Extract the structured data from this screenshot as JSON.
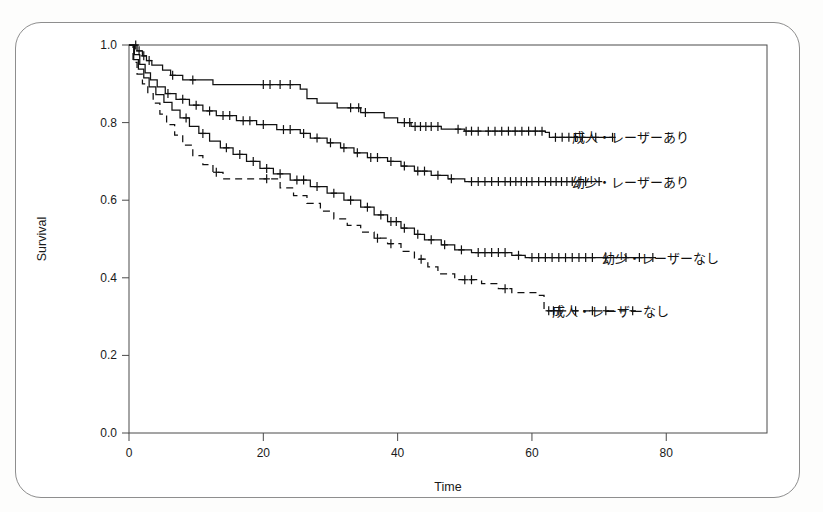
{
  "page": {
    "faint_header_text": "",
    "background": "#ffffff",
    "border_color": "#8e8e8e"
  },
  "chart_data": {
    "type": "line",
    "subtype": "kaplan-meier-survival",
    "title": "",
    "xlabel": "Time",
    "ylabel": "Survival",
    "xlim": [
      0,
      95
    ],
    "ylim": [
      0,
      1.0
    ],
    "xticks": [
      0,
      20,
      40,
      60,
      80
    ],
    "xtick_labels": [
      "0",
      "20",
      "40",
      "60",
      "80"
    ],
    "yticks": [
      0.0,
      0.2,
      0.4,
      0.6,
      0.8,
      1.0
    ],
    "ytick_labels": [
      "0.0",
      "0.2",
      "0.4",
      "0.6",
      "0.8",
      "1.0"
    ],
    "grid": false,
    "legend_position": "right-inline-at-curve-end",
    "line_color": "#111111",
    "series": [
      {
        "name": "成人・レーザーあり",
        "label": "成人・レーザーあり",
        "dash": "none",
        "label_x": 65.5,
        "label_y": 0.762,
        "steps": [
          [
            0,
            1.0
          ],
          [
            1.2,
            0.985
          ],
          [
            2.0,
            0.972
          ],
          [
            2.6,
            0.96
          ],
          [
            3.4,
            0.948
          ],
          [
            5.0,
            0.935
          ],
          [
            6.2,
            0.922
          ],
          [
            8.0,
            0.91
          ],
          [
            12.5,
            0.898
          ],
          [
            25.5,
            0.886
          ],
          [
            26.5,
            0.862
          ],
          [
            28.0,
            0.85
          ],
          [
            31.0,
            0.838
          ],
          [
            34.5,
            0.826
          ],
          [
            38.0,
            0.812
          ],
          [
            40.0,
            0.8
          ],
          [
            42.0,
            0.79
          ],
          [
            46.5,
            0.783
          ],
          [
            50.0,
            0.778
          ],
          [
            62.0,
            0.775
          ],
          [
            62.6,
            0.762
          ],
          [
            72.0,
            0.762
          ]
        ],
        "censor_times": [
          1.0,
          1.5,
          2.2,
          3.0,
          6.5,
          9.5,
          20.0,
          21.0,
          22.5,
          24.0,
          33.0,
          34.2,
          35.2,
          41.0,
          41.8,
          42.6,
          43.4,
          44.2,
          45.0,
          46.0,
          49.0,
          50.2,
          51.0,
          52.0,
          53.5,
          54.5,
          55.5,
          56.5,
          57.5,
          58.5,
          59.5,
          60.5,
          61.5,
          63.5,
          64.5,
          65.5,
          66.5,
          67.5,
          69.5,
          72.0
        ]
      },
      {
        "name": "幼少・レーザーあり",
        "label": "幼少・レーザーあり",
        "dash": "none",
        "label_x": 65.5,
        "label_y": 0.648,
        "steps": [
          [
            0,
            1.0
          ],
          [
            0.8,
            0.975
          ],
          [
            1.6,
            0.95
          ],
          [
            2.4,
            0.928
          ],
          [
            3.2,
            0.91
          ],
          [
            4.2,
            0.892
          ],
          [
            5.4,
            0.875
          ],
          [
            7.0,
            0.86
          ],
          [
            9.0,
            0.845
          ],
          [
            11.0,
            0.83
          ],
          [
            13.0,
            0.818
          ],
          [
            16.0,
            0.805
          ],
          [
            19.0,
            0.795
          ],
          [
            22.0,
            0.782
          ],
          [
            25.5,
            0.772
          ],
          [
            27.0,
            0.76
          ],
          [
            29.5,
            0.748
          ],
          [
            31.5,
            0.735
          ],
          [
            33.5,
            0.722
          ],
          [
            35.5,
            0.71
          ],
          [
            38.5,
            0.7
          ],
          [
            40.5,
            0.688
          ],
          [
            42.5,
            0.675
          ],
          [
            45.0,
            0.664
          ],
          [
            47.5,
            0.655
          ],
          [
            50.0,
            0.648
          ],
          [
            70.0,
            0.648
          ]
        ],
        "censor_times": [
          5.8,
          8.0,
          10.0,
          12.0,
          14.0,
          15.0,
          17.0,
          18.0,
          20.0,
          23.0,
          24.0,
          26.0,
          28.0,
          30.0,
          32.0,
          34.0,
          36.0,
          37.0,
          39.0,
          41.0,
          43.0,
          44.0,
          46.0,
          48.0,
          51.0,
          52.0,
          53.0,
          54.0,
          55.0,
          56.0,
          56.8,
          57.6,
          58.4,
          59.2,
          60.0,
          61.0,
          62.0,
          62.8,
          63.6,
          64.4,
          65.2,
          66.0,
          67.0,
          68.0,
          70.0
        ]
      },
      {
        "name": "幼少・レーザーなし",
        "label": "幼少・レーザーなし",
        "dash": "none",
        "label_x": 70.0,
        "label_y": 0.452,
        "steps": [
          [
            0,
            1.0
          ],
          [
            0.7,
            0.962
          ],
          [
            1.4,
            0.938
          ],
          [
            2.2,
            0.915
          ],
          [
            3.0,
            0.892
          ],
          [
            4.0,
            0.872
          ],
          [
            5.2,
            0.852
          ],
          [
            6.4,
            0.832
          ],
          [
            7.6,
            0.812
          ],
          [
            9.0,
            0.79
          ],
          [
            10.4,
            0.772
          ],
          [
            12.0,
            0.752
          ],
          [
            13.6,
            0.735
          ],
          [
            15.5,
            0.718
          ],
          [
            17.5,
            0.7
          ],
          [
            19.5,
            0.682
          ],
          [
            21.5,
            0.668
          ],
          [
            24.0,
            0.652
          ],
          [
            27.0,
            0.635
          ],
          [
            29.5,
            0.618
          ],
          [
            32.0,
            0.6
          ],
          [
            34.5,
            0.582
          ],
          [
            36.5,
            0.562
          ],
          [
            38.5,
            0.545
          ],
          [
            40.5,
            0.528
          ],
          [
            42.5,
            0.512
          ],
          [
            44.0,
            0.498
          ],
          [
            46.5,
            0.485
          ],
          [
            48.5,
            0.472
          ],
          [
            51.0,
            0.465
          ],
          [
            57.0,
            0.458
          ],
          [
            59.0,
            0.452
          ],
          [
            78.0,
            0.452
          ]
        ],
        "censor_times": [
          8.5,
          11.0,
          14.5,
          16.5,
          18.5,
          20.5,
          22.5,
          25.0,
          26.0,
          28.0,
          30.5,
          33.0,
          35.5,
          37.5,
          39.0,
          39.8,
          41.0,
          43.0,
          45.0,
          47.0,
          49.5,
          52.0,
          53.0,
          54.0,
          55.0,
          56.0,
          58.0,
          60.0,
          61.0,
          62.0,
          63.0,
          64.0,
          65.0,
          66.0,
          67.0,
          68.0,
          69.0,
          71.0,
          74.0,
          76.0,
          78.0
        ]
      },
      {
        "name": "成人・レーザーなし",
        "label": "成人・レーザーなし",
        "dash": "dashed",
        "label_x": 62.5,
        "label_y": 0.315,
        "steps": [
          [
            0,
            1.0
          ],
          [
            0.6,
            0.955
          ],
          [
            1.2,
            0.925
          ],
          [
            2.0,
            0.9
          ],
          [
            2.8,
            0.875
          ],
          [
            3.6,
            0.85
          ],
          [
            4.6,
            0.822
          ],
          [
            5.6,
            0.795
          ],
          [
            6.8,
            0.768
          ],
          [
            8.0,
            0.742
          ],
          [
            9.5,
            0.715
          ],
          [
            11.0,
            0.692
          ],
          [
            12.5,
            0.672
          ],
          [
            14.0,
            0.655
          ],
          [
            21.0,
            0.655
          ],
          [
            22.5,
            0.632
          ],
          [
            24.5,
            0.612
          ],
          [
            26.5,
            0.592
          ],
          [
            28.5,
            0.572
          ],
          [
            30.5,
            0.552
          ],
          [
            32.5,
            0.535
          ],
          [
            34.5,
            0.518
          ],
          [
            36.5,
            0.502
          ],
          [
            38.5,
            0.488
          ],
          [
            40.5,
            0.468
          ],
          [
            42.5,
            0.448
          ],
          [
            44.5,
            0.428
          ],
          [
            46.0,
            0.41
          ],
          [
            48.5,
            0.395
          ],
          [
            52.5,
            0.385
          ],
          [
            55.0,
            0.372
          ],
          [
            57.0,
            0.362
          ],
          [
            61.0,
            0.355
          ],
          [
            61.8,
            0.315
          ],
          [
            75.0,
            0.315
          ]
        ],
        "censor_times": [
          13.0,
          20.5,
          37.0,
          39.0,
          43.5,
          50.0,
          51.0,
          56.0,
          62.5,
          63.2,
          64.0,
          66.5,
          69.0,
          71.0,
          75.0
        ]
      }
    ]
  }
}
